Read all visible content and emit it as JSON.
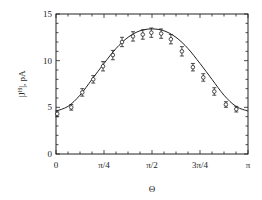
{
  "chart_data": {
    "type": "scatter",
    "title": "",
    "xlabel": "Θ",
    "ylabel": "|J^H|, pA",
    "xlim": [
      0,
      3.14159
    ],
    "ylim": [
      0,
      15
    ],
    "grid": false,
    "legend": null,
    "x_ticks": [
      {
        "value": 0,
        "label": "0"
      },
      {
        "value": 0.7854,
        "label": "π/4"
      },
      {
        "value": 1.5708,
        "label": "π/2"
      },
      {
        "value": 2.3562,
        "label": "3π/4"
      },
      {
        "value": 3.1416,
        "label": "π"
      }
    ],
    "y_ticks": [
      {
        "value": 0,
        "label": "0"
      },
      {
        "value": 5,
        "label": "5"
      },
      {
        "value": 10,
        "label": "10"
      },
      {
        "value": 15,
        "label": "15"
      }
    ],
    "series": [
      {
        "name": "measured",
        "style": "open-circle-with-errorbars",
        "x": [
          0.02,
          0.25,
          0.43,
          0.61,
          0.77,
          0.93,
          1.08,
          1.26,
          1.42,
          1.56,
          1.72,
          1.88,
          2.06,
          2.24,
          2.41,
          2.59,
          2.78,
          2.95
        ],
        "y": [
          4.3,
          5.0,
          6.6,
          8.0,
          9.4,
          10.6,
          12.0,
          12.6,
          12.8,
          13.0,
          12.9,
          12.3,
          11.0,
          9.3,
          8.2,
          6.7,
          5.3,
          4.8
        ],
        "error": [
          0.3,
          0.3,
          0.4,
          0.4,
          0.5,
          0.5,
          0.5,
          0.5,
          0.5,
          0.5,
          0.5,
          0.5,
          0.5,
          0.4,
          0.4,
          0.4,
          0.3,
          0.3
        ]
      },
      {
        "name": "fit",
        "style": "solid-line",
        "x": [
          0,
          0.1963,
          0.3927,
          0.589,
          0.7854,
          0.9817,
          1.1781,
          1.3744,
          1.5708,
          1.7671,
          1.9635,
          2.1598,
          2.3562,
          2.5525,
          2.7489,
          2.9452,
          3.1416
        ],
        "y": [
          4.6,
          5.1,
          6.3,
          8.0,
          9.7,
          11.3,
          12.5,
          13.2,
          13.4,
          13.2,
          12.5,
          11.3,
          9.7,
          8.0,
          6.3,
          5.1,
          4.6
        ]
      }
    ]
  }
}
